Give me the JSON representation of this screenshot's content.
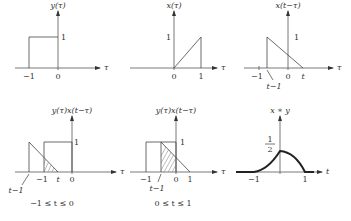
{
  "panels": [
    {
      "id": "y",
      "title": "y(τ)",
      "axis_var": "τ",
      "ticks_x": [
        "−1",
        "0"
      ],
      "ticks_y": [
        "1"
      ],
      "description": "rectangular pulse of height 1 on [−1, 0]"
    },
    {
      "id": "x",
      "title": "x(τ)",
      "axis_var": "τ",
      "ticks_x": [
        "0",
        "1"
      ],
      "ticks_y": [
        "1"
      ],
      "description": "ramp from 0 to 1 on [0, 1], then drops to 0"
    },
    {
      "id": "x-flipped",
      "title": "x(t−τ)",
      "axis_var": "τ",
      "ticks_x": [
        "−1",
        "0",
        "t"
      ],
      "ticks_y": [
        "1"
      ],
      "annotation": "t−1",
      "description": "reflected and shifted ramp on [t−1, t]"
    },
    {
      "id": "product-case1",
      "title": "y(τ)x(t−τ)",
      "axis_var": "τ",
      "ticks_x": [
        "−1",
        "t",
        "0"
      ],
      "ticks_y": [
        "1"
      ],
      "annotation": "t−1",
      "caption": "−1 ≤ t ≤ 0",
      "description": "overlap region shaded between −1 and t"
    },
    {
      "id": "product-case2",
      "title": "y(τ)x(t−τ)",
      "axis_var": "τ",
      "ticks_x": [
        "−1",
        "0",
        "1"
      ],
      "ticks_y": [
        "1"
      ],
      "annotation": "t−1",
      "caption": "0 ≤ t ≤ 1",
      "description": "overlap region shaded between t−1 and 0"
    },
    {
      "id": "convolution",
      "title": "x ∗ y",
      "axis_var": "t",
      "ticks_x": [
        "−1",
        "1"
      ],
      "peak_label_num": "1",
      "peak_label_den": "2",
      "description": "result rises from −1 to peak 1/2 at 0, falls to 0 at 1"
    }
  ]
}
